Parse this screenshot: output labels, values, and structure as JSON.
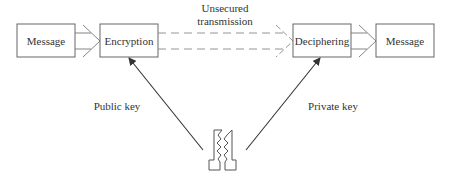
{
  "diagram": {
    "boxes": [
      {
        "id": "message-in",
        "label": "Message"
      },
      {
        "id": "encryption",
        "label": "Encryption"
      },
      {
        "id": "deciphering",
        "label": "Deciphering"
      },
      {
        "id": "message-out",
        "label": "Message"
      }
    ],
    "channel_label_line1": "Unsecured",
    "channel_label_line2": "transmission",
    "public_key_label": "Public key",
    "private_key_label": "Private key",
    "key_icon": "key-pair-icon",
    "colors": {
      "stroke": "#555555",
      "dashed": "#888888",
      "text": "#333333",
      "background": "#ffffff"
    }
  }
}
